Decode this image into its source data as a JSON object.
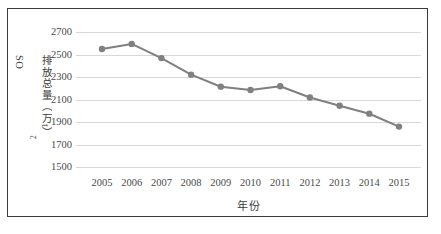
{
  "figure": {
    "border_color": "#3a3a3a",
    "background": "#ffffff"
  },
  "chart_data": {
    "type": "line",
    "title": "",
    "xlabel": "年份",
    "ylabel": "SO2排放总量（万t）",
    "ylabel_base": "SO",
    "ylabel_sub": "2",
    "ylabel_rest": "排放总量（万t）",
    "categories": [
      "2005",
      "2006",
      "2007",
      "2008",
      "2009",
      "2010",
      "2011",
      "2012",
      "2013",
      "2014",
      "2015"
    ],
    "values": [
      2549,
      2594,
      2468,
      2321,
      2214,
      2185,
      2218,
      2118,
      2044,
      1974,
      1859
    ],
    "series": [
      {
        "name": "SO2排放总量",
        "color": "#808080",
        "marker": "circle",
        "values": [
          2549,
          2594,
          2468,
          2321,
          2214,
          2185,
          2218,
          2118,
          2044,
          1974,
          1859
        ]
      }
    ],
    "ylim": [
      1500,
      2700
    ],
    "ytick_step": 200,
    "yticks": [
      "2700",
      "2500",
      "2300",
      "2100",
      "1900",
      "1700",
      "1500"
    ],
    "ytick_values": [
      2700,
      2500,
      2300,
      2100,
      1900,
      1700,
      1500
    ],
    "grid": true,
    "grid_color": "#d8d8d8",
    "legend": "none",
    "line_color": "#808080",
    "marker_color": "#808080"
  }
}
